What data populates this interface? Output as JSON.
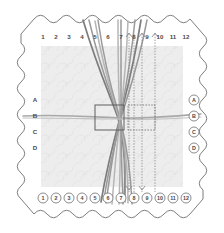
{
  "figure": {
    "title": "Scalloped-edge loom diagram with numbered pin positions and crossing threads",
    "colors": {
      "outline": "#6e6e6e",
      "field": "#ededed",
      "thread": "#9a9a9a",
      "thread_dark": "#7d7d7d",
      "thread_light": "#b5b5b5",
      "dotted": "#8c8c8c",
      "box_solid": "#5e5e5e",
      "box_dashed": "#7a7a7a",
      "label": "#4a4a4a",
      "background": "#ffffff"
    },
    "top_labels": [
      "1",
      "2",
      "3",
      "4",
      "5",
      "6",
      "7",
      "8",
      "9",
      "10",
      "11",
      "12"
    ],
    "bottom_labels": [
      "1",
      "2",
      "3",
      "4",
      "5",
      "6",
      "7",
      "8",
      "9",
      "10",
      "11",
      "12"
    ],
    "left_labels": [
      "A",
      "B",
      "C",
      "D"
    ],
    "right_labels": [
      "A",
      "B",
      "C",
      "D"
    ],
    "top_arrow_positions": [
      "7",
      "8",
      "9"
    ],
    "bottom_arrow_positions": [
      "7",
      "8"
    ],
    "scallop_count_top": 12,
    "scallop_count_bottom": 12,
    "scallop_count_left": 4,
    "scallop_count_right": 4,
    "center_boxes": [
      {
        "name": "solid-box",
        "style": "solid"
      },
      {
        "name": "dashed-box",
        "style": "dashed"
      }
    ]
  }
}
